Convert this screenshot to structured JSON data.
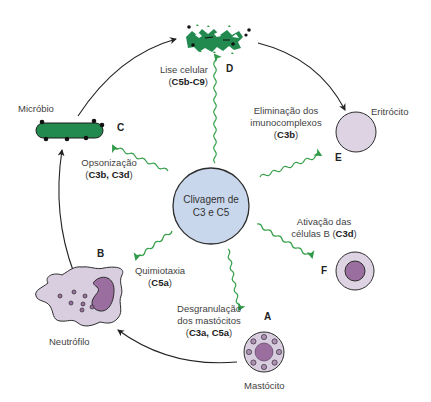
{
  "diagram": {
    "type": "cycle",
    "colors": {
      "hub_fill": "#c9d7ec",
      "hub_stroke": "#2d2d2d",
      "microbe_green": "#22894f",
      "signal_arrow_green": "#37a04b",
      "cell_purple_light": "#d9cde0",
      "cell_purple_dark": "#9a6f9f",
      "erythrocyte_fill": "#ddd3e2",
      "arrow_black": "#222222"
    },
    "hub": {
      "line1": "Clivagem de",
      "line2": "C3 e C5"
    },
    "nodes": [
      {
        "id": "A",
        "letter": "A",
        "cell": "Mastócito",
        "function_line1": "Desgranulação",
        "function_line2": "dos mastócitos",
        "mediators_open": "(",
        "mediators": "C3a, C5a",
        "mediators_close": ")"
      },
      {
        "id": "B",
        "letter": "B",
        "cell": "Neutrófilo",
        "function_line1": "Quimiotaxia",
        "mediators_open": "(",
        "mediators": "C5a",
        "mediators_close": ")"
      },
      {
        "id": "C",
        "letter": "C",
        "cell": "Micróbio",
        "function_line1": "Opsonização",
        "mediators_open": "(",
        "mediators": "C3b, C3d",
        "mediators_close": ")"
      },
      {
        "id": "D",
        "letter": "D",
        "function_line1": "Lise celular",
        "mediators_open": "(",
        "mediators": "C5b-C9",
        "mediators_close": ")"
      },
      {
        "id": "E",
        "letter": "E",
        "cell": "Eritrócito",
        "function_line1": "Eliminação dos",
        "function_line2": "imunocomplexos",
        "mediators_open": "(",
        "mediators": "C3b",
        "mediators_close": ")"
      },
      {
        "id": "F",
        "letter": "F",
        "function_line1": "Ativação das",
        "function_line2_prefix": "células B (",
        "mediators": "C3d",
        "mediators_close": ")"
      }
    ],
    "cycle_arrows": [
      "Mastócito → Neutrófilo",
      "Neutrófilo → Micróbio",
      "Micróbio → Micróbio lisado",
      "Micróbio lisado → Eritrócito"
    ]
  }
}
